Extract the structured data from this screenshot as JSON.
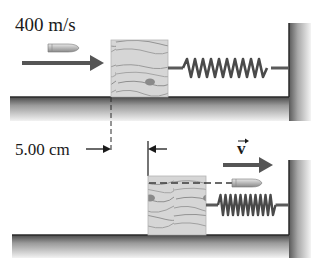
{
  "diagram": {
    "top_panel": {
      "speed_label": "400 m/s",
      "objects": [
        "bullet",
        "velocity-arrow",
        "wooden-block",
        "spring",
        "wall",
        "floor"
      ]
    },
    "bottom_panel": {
      "distance_label": "5.00 cm",
      "velocity_label": "v",
      "objects": [
        "wooden-block-with-embedded-bullet-path",
        "exiting-bullet",
        "velocity-arrow",
        "compressed-spring",
        "wall",
        "floor"
      ]
    },
    "colors": {
      "ink": "#2a2a2a",
      "arrow": "#555555",
      "floor_dark": "#444444",
      "floor_light": "#d0d0d0",
      "wood": "#c8c8c8",
      "spring": "#5a5a5a"
    }
  }
}
